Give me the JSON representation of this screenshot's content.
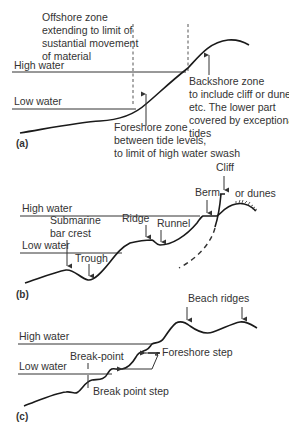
{
  "figure": {
    "panel_a": {
      "panel_label": "(a)",
      "high_water": "High water",
      "low_water": "Low water",
      "offshore": [
        "Offshore zone",
        "extending to limit of",
        "sustantial movement",
        "of material"
      ],
      "backshore": [
        "Backshore zone",
        "to include cliff or dunes,",
        "etc. The lower part",
        "covered by exceptional",
        "tides"
      ],
      "foreshore": [
        "Foreshore zone",
        "between tide levels,",
        "to limit of high water swash"
      ]
    },
    "panel_b": {
      "panel_label": "(b)",
      "high_water": "High water",
      "low_water": "Low water",
      "cliff": "Cliff",
      "berm": "Berm",
      "or_dunes": "or dunes",
      "submarine_bar": [
        "Submarine",
        "bar crest"
      ],
      "trough": "Trough",
      "ridge": "Ridge",
      "runnel": "Runnel"
    },
    "panel_c": {
      "panel_label": "(c)",
      "high_water": "High water",
      "low_water": "Low water",
      "beach_ridges": "Beach ridges",
      "break_point": "Break-point",
      "foreshore_step": "Foreshore step",
      "break_point_step": "Break point step"
    }
  }
}
